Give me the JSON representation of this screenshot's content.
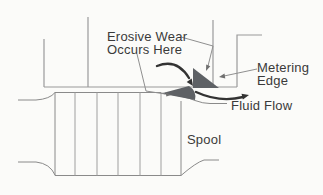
{
  "figure": {
    "labels": {
      "erosive_wear_line1": "Erosive Wear",
      "erosive_wear_line2": "Occurs Here",
      "metering_line1": "Metering",
      "metering_line2": "Edge",
      "fluid_flow": "Fluid Flow",
      "spool": "Spool"
    },
    "colors": {
      "background": "#fbfbf9",
      "body_line": "#9a9a9a",
      "spool_line": "#8a8a8a",
      "wear_fill": "#5e6165",
      "arrow": "#333333",
      "text": "#3a3a3a"
    }
  }
}
